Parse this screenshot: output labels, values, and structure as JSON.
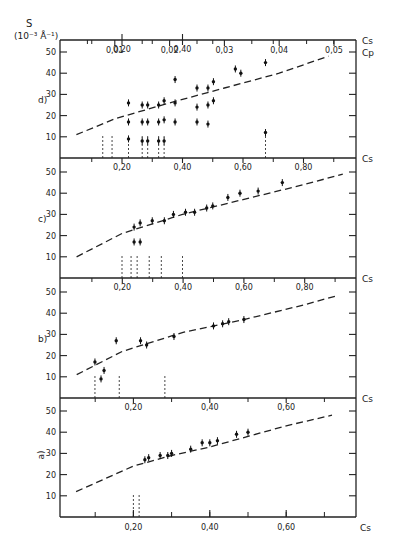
{
  "figure": {
    "y_axis_label": "S",
    "y_axis_unit": "(10⁻³ Å⁻¹)",
    "top_axis_label": "Cp",
    "cs_label": "Cs"
  },
  "chart_data": [
    {
      "panel": "d)",
      "type": "scatter",
      "ylabel": "S (10^-3 Å^-1)",
      "xlabel_bottom": "Cs",
      "xlabel_top": "Cp",
      "yticks": [
        10,
        20,
        30,
        40,
        50
      ],
      "ylim": [
        0,
        55
      ],
      "xticks_bottom": [
        "0,20",
        "0,40"
      ],
      "xticks_top": [
        "0,01",
        "0,02",
        "0,03",
        "0,04",
        "0,05"
      ],
      "xlim_top": [
        0,
        0.055
      ],
      "fit_curve": {
        "style": "dashed",
        "x": [
          0.003,
          0.01,
          0.02,
          0.03,
          0.04,
          0.049
        ],
        "y": [
          11,
          18.5,
          26,
          33,
          40,
          48
        ]
      },
      "points": [
        {
          "x": 0.0125,
          "y": 26
        },
        {
          "x": 0.0125,
          "y": 17
        },
        {
          "x": 0.0125,
          "y": 9
        },
        {
          "x": 0.015,
          "y": 25
        },
        {
          "x": 0.015,
          "y": 17
        },
        {
          "x": 0.015,
          "y": 8
        },
        {
          "x": 0.016,
          "y": 25
        },
        {
          "x": 0.016,
          "y": 17
        },
        {
          "x": 0.016,
          "y": 8
        },
        {
          "x": 0.018,
          "y": 25
        },
        {
          "x": 0.018,
          "y": 17
        },
        {
          "x": 0.018,
          "y": 8
        },
        {
          "x": 0.019,
          "y": 27
        },
        {
          "x": 0.019,
          "y": 18
        },
        {
          "x": 0.019,
          "y": 8
        },
        {
          "x": 0.021,
          "y": 37
        },
        {
          "x": 0.021,
          "y": 26
        },
        {
          "x": 0.021,
          "y": 17
        },
        {
          "x": 0.025,
          "y": 33
        },
        {
          "x": 0.025,
          "y": 24
        },
        {
          "x": 0.025,
          "y": 17
        },
        {
          "x": 0.027,
          "y": 33
        },
        {
          "x": 0.027,
          "y": 25
        },
        {
          "x": 0.027,
          "y": 16
        },
        {
          "x": 0.028,
          "y": 36
        },
        {
          "x": 0.028,
          "y": 27
        },
        {
          "x": 0.032,
          "y": 42
        },
        {
          "x": 0.033,
          "y": 40
        },
        {
          "x": 0.0375,
          "y": 45
        },
        {
          "x": 0.0375,
          "y": 12
        }
      ],
      "vlines_x": [
        0.0078,
        0.0095,
        0.0125,
        0.015,
        0.016,
        0.018,
        0.019,
        0.0375
      ]
    },
    {
      "panel": "c)",
      "type": "scatter",
      "ylabel": "S (10^-3 Å^-1)",
      "xlabel": "Cs",
      "yticks": [
        10,
        20,
        30,
        40,
        50
      ],
      "xticks": [
        "0,20",
        "0,40",
        "0,60",
        "0,80"
      ],
      "xlim": [
        0,
        0.97
      ],
      "ylim": [
        0,
        55
      ],
      "fit_curve": {
        "style": "dashed",
        "x": [
          0.05,
          0.2,
          0.4,
          0.6,
          0.8,
          0.93
        ],
        "y": [
          10,
          21,
          30,
          37,
          44,
          49
        ]
      },
      "points": [
        {
          "x": 0.24,
          "y": 24
        },
        {
          "x": 0.26,
          "y": 26
        },
        {
          "x": 0.3,
          "y": 27
        },
        {
          "x": 0.34,
          "y": 27
        },
        {
          "x": 0.37,
          "y": 30
        },
        {
          "x": 0.41,
          "y": 31
        },
        {
          "x": 0.44,
          "y": 31
        },
        {
          "x": 0.48,
          "y": 33
        },
        {
          "x": 0.5,
          "y": 34
        },
        {
          "x": 0.55,
          "y": 38
        },
        {
          "x": 0.59,
          "y": 40
        },
        {
          "x": 0.65,
          "y": 41
        },
        {
          "x": 0.73,
          "y": 45
        },
        {
          "x": 0.24,
          "y": 17
        },
        {
          "x": 0.26,
          "y": 17
        }
      ],
      "vlines_x": [
        0.2,
        0.23,
        0.25,
        0.29,
        0.33,
        0.4
      ]
    },
    {
      "panel": "b)",
      "type": "scatter",
      "ylabel": "S (10^-3 Å^-1)",
      "xlabel": "Cs",
      "yticks": [
        10,
        20,
        30,
        40,
        50
      ],
      "xticks": [
        "0,20",
        "0,40",
        "0,60",
        "0,80"
      ],
      "xlim": [
        0,
        0.97
      ],
      "ylim": [
        0,
        55
      ],
      "fit_curve": {
        "style": "dashed",
        "x": [
          0.05,
          0.2,
          0.4,
          0.6,
          0.8,
          0.9
        ],
        "y": [
          11,
          22,
          31,
          37,
          44,
          48
        ]
      },
      "points": [
        {
          "x": 0.13,
          "y": 9
        },
        {
          "x": 0.14,
          "y": 13
        },
        {
          "x": 0.11,
          "y": 17
        },
        {
          "x": 0.18,
          "y": 27
        },
        {
          "x": 0.26,
          "y": 27
        },
        {
          "x": 0.28,
          "y": 25
        },
        {
          "x": 0.37,
          "y": 29
        },
        {
          "x": 0.5,
          "y": 34
        },
        {
          "x": 0.53,
          "y": 35
        },
        {
          "x": 0.55,
          "y": 36
        },
        {
          "x": 0.6,
          "y": 37
        }
      ],
      "vlines_x": [
        0.11,
        0.19,
        0.34
      ]
    },
    {
      "panel": "a)",
      "type": "scatter",
      "ylabel": "S (10^-3 Å^-1)",
      "xlabel": "Cs",
      "yticks": [
        10,
        20,
        30,
        40,
        50
      ],
      "xticks": [
        "0,20",
        "0,40",
        "0,60"
      ],
      "xlim": [
        0,
        0.76
      ],
      "ylim": [
        0,
        55
      ],
      "fit_curve": {
        "style": "dashed",
        "x": [
          0.05,
          0.2,
          0.3,
          0.4,
          0.5,
          0.6,
          0.72
        ],
        "y": [
          12,
          24,
          29,
          33,
          38,
          43,
          48
        ]
      },
      "points": [
        {
          "x": 0.23,
          "y": 27
        },
        {
          "x": 0.24,
          "y": 28
        },
        {
          "x": 0.27,
          "y": 29
        },
        {
          "x": 0.29,
          "y": 29
        },
        {
          "x": 0.3,
          "y": 30
        },
        {
          "x": 0.35,
          "y": 32
        },
        {
          "x": 0.38,
          "y": 35
        },
        {
          "x": 0.4,
          "y": 35
        },
        {
          "x": 0.42,
          "y": 36
        },
        {
          "x": 0.47,
          "y": 39
        },
        {
          "x": 0.5,
          "y": 40
        }
      ],
      "vlines_x": [
        0.2,
        0.215
      ]
    }
  ]
}
